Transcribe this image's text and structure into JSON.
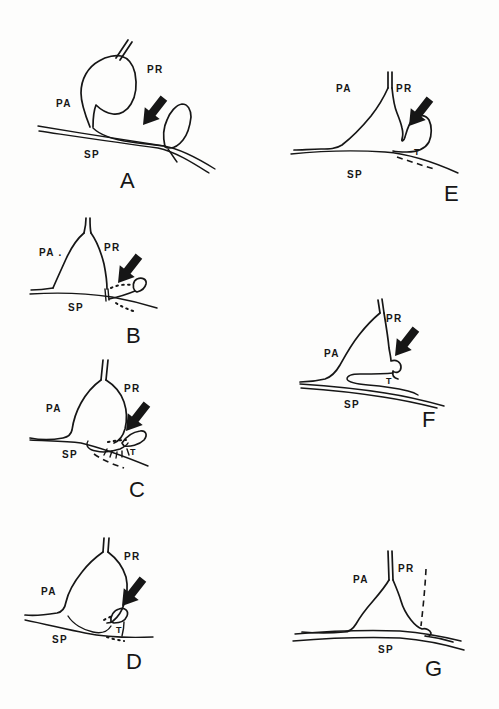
{
  "colors": {
    "ink": "#161616",
    "paper": "#fdfdfc"
  },
  "panels": {
    "a": {
      "letter": "A",
      "pa": "PA",
      "pr": "PR",
      "sp": "SP"
    },
    "b": {
      "letter": "B",
      "pa": "PA .",
      "pr": "PR",
      "sp": "SP"
    },
    "c": {
      "letter": "C",
      "pa": "PA",
      "pr": "PR",
      "sp": "SP",
      "t": "T"
    },
    "d": {
      "letter": "D",
      "pa": "PA",
      "pr": "PR",
      "sp": "SP",
      "t": "T"
    },
    "e": {
      "letter": "E",
      "pa": "PA",
      "pr": "PR",
      "sp": "SP",
      "t": "T"
    },
    "f": {
      "letter": "F",
      "pa": "PA",
      "pr": "PR",
      "sp": "SP",
      "t": "T"
    },
    "g": {
      "letter": "G",
      "pa": "PA",
      "pr": "PR",
      "sp": "SP"
    }
  }
}
